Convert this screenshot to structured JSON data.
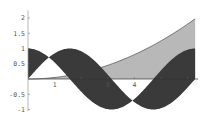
{
  "chart_data": {
    "type": "area",
    "title": "",
    "xlabel": "",
    "ylabel": "",
    "xlim": [
      0,
      6.2832
    ],
    "ylim": [
      -1,
      2.2
    ],
    "grid": false,
    "legend": null,
    "x_ticks": [
      {
        "value": 1,
        "label": "1"
      },
      {
        "value": 2,
        "label": ""
      },
      {
        "value": 3,
        "label": "3"
      },
      {
        "value": 4,
        "label": "4"
      },
      {
        "value": 5,
        "label": ""
      },
      {
        "value": 6,
        "label": ""
      }
    ],
    "y_ticks": [
      {
        "value": -1,
        "label": "-1"
      },
      {
        "value": -0.5,
        "label": "-0.5"
      },
      {
        "value": 0.5,
        "label": "0.5"
      },
      {
        "value": 1,
        "label": "1"
      },
      {
        "value": 1.5,
        "label": "1.5"
      },
      {
        "value": 2,
        "label": "2"
      }
    ],
    "series": [
      {
        "name": "sin(x)",
        "fill_to": "cos(x)",
        "fill_color": "#3a3a3a"
      },
      {
        "name": "cos(x)",
        "fill_to": "sin(x)",
        "fill_color": "#3a3a3a"
      },
      {
        "name": "x^2/20",
        "fill_to": "axis",
        "fill_color": "#b8b8b8"
      }
    ],
    "sample_points": {
      "x": [
        0,
        0.785,
        1.571,
        2.356,
        3.142,
        3.927,
        4.712,
        5.498,
        6.283
      ],
      "sin": [
        0,
        0.707,
        1,
        0.707,
        0,
        -0.707,
        -1,
        -0.707,
        0
      ],
      "cos": [
        1,
        0.707,
        0,
        -0.707,
        -1,
        -0.707,
        0,
        0.707,
        1
      ],
      "x2_over_20": [
        0,
        0.031,
        0.123,
        0.278,
        0.493,
        0.771,
        1.11,
        1.511,
        1.974
      ]
    }
  },
  "colors": {
    "band": "#3a3a3a",
    "area": "#b8b8b8",
    "axis": "#999999",
    "curve": "#555555"
  }
}
